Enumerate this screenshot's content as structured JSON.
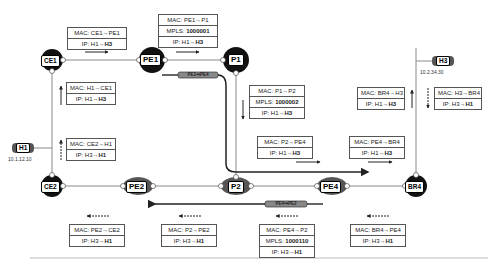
{
  "nodes": {
    "h1": {
      "label": "H1",
      "ip": "10.1.12.10"
    },
    "h3": {
      "label": "H3",
      "ip": "10.2.34.30"
    },
    "ce1": {
      "label": "CE1"
    },
    "pe1": {
      "label": "PE1"
    },
    "p1": {
      "label": "P1"
    },
    "p2": {
      "label": "P2"
    },
    "pe2": {
      "label": "PE2"
    },
    "pe4": {
      "label": "PE4"
    },
    "ce2": {
      "label": "CE2"
    },
    "br4": {
      "label": "BR4"
    }
  },
  "tunnels": {
    "pe1_pe4": "PE1⇒PE4",
    "pe4_pe2": "PE4⇒PE2"
  },
  "forward_headers": [
    {
      "id": "h1_ce1",
      "mac": "MAC: H1→CE1",
      "ip_prefix": "IP: H1→",
      "ip_dst": "H3"
    },
    {
      "id": "ce1_pe1",
      "mac": "MAC: CE1→PE1",
      "ip_prefix": "IP: H1→",
      "ip_dst": "H3"
    },
    {
      "id": "pe1_p1",
      "mac": "MAC: PE1→P1",
      "mpls_prefix": "MPLS: ",
      "mpls": "1000001",
      "ip_prefix": "IP: H1→",
      "ip_dst": "H3"
    },
    {
      "id": "p1_p2",
      "mac": "MAC: P1→P2",
      "mpls_prefix": "MPLS: ",
      "mpls": "1000002",
      "ip_prefix": "IP: H1→",
      "ip_dst": "H3"
    },
    {
      "id": "p2_pe4",
      "mac": "MAC: P2→PE4",
      "ip_prefix": "IP: H1→",
      "ip_dst": "H3"
    },
    {
      "id": "pe4_br4",
      "mac": "MAC: PE4→BR4",
      "ip_prefix": "IP: H1→",
      "ip_dst": "H3"
    },
    {
      "id": "br4_h3",
      "mac": "MAC: BR4→H3",
      "ip_prefix": "IP: H1→",
      "ip_dst": "H3"
    }
  ],
  "return_headers": [
    {
      "id": "h3_br4",
      "mac": "MAC: H3→BR4",
      "ip_prefix": "IP: H3→",
      "ip_dst": "H1"
    },
    {
      "id": "br4_pe4",
      "mac": "MAC: BR4→PE4",
      "ip_prefix": "IP: H3→",
      "ip_dst": "H1"
    },
    {
      "id": "pe4_p2",
      "mac": "MAC: PE4→P2",
      "mpls_prefix": "MPLS: ",
      "mpls": "1000110",
      "ip_prefix": "IP: H3→",
      "ip_dst": "H1"
    },
    {
      "id": "p2_pe2",
      "mac": "MAC: P2→PE2",
      "ip_prefix": "IP: H3→",
      "ip_dst": "H1"
    },
    {
      "id": "pe2_ce2",
      "mac": "MAC: PE2→CE2",
      "ip_prefix": "IP: H3→",
      "ip_dst": "H1"
    },
    {
      "id": "ce2_h1",
      "mac": "MAC: CE2→H1",
      "ip_prefix": "IP: H3→",
      "ip_dst": "H1"
    }
  ],
  "ports": {
    "p1": "1",
    "p2": "2"
  }
}
